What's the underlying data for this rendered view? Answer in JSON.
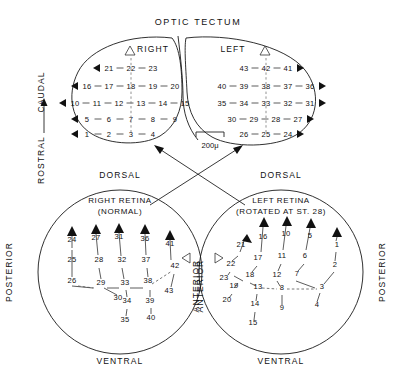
{
  "figure": {
    "title": "OPTIC TECTUM",
    "scale_bar_label": "200μ"
  },
  "tectum": {
    "right_label": "RIGHT",
    "left_label": "LEFT",
    "axis_label_rostral": "ROSTRAL",
    "axis_label_caudal": "CAUDAL",
    "right_lobe_rows": [
      {
        "values": [
          "21",
          "22",
          "23"
        ],
        "arrow": "left"
      },
      {
        "values": [
          "16",
          "17",
          "18",
          "19",
          "20"
        ],
        "arrow": "left"
      },
      {
        "values": [
          "10",
          "11",
          "12",
          "13",
          "14",
          "15"
        ],
        "arrow": "left"
      },
      {
        "values": [
          "5",
          "6",
          "7",
          "8",
          "9"
        ],
        "arrow": "left"
      },
      {
        "values": [
          "1",
          "2",
          "3",
          "4"
        ],
        "arrow": "left"
      }
    ],
    "left_lobe_rows": [
      {
        "values": [
          "43",
          "42",
          "41"
        ],
        "arrow": "right"
      },
      {
        "values": [
          "40",
          "39",
          "38",
          "37",
          "36"
        ],
        "arrow": "right"
      },
      {
        "values": [
          "35",
          "34",
          "33",
          "32",
          "31"
        ],
        "arrow": "right"
      },
      {
        "values": [
          "30",
          "29",
          "28",
          "27"
        ],
        "arrow": "right"
      },
      {
        "values": [
          "26",
          "25",
          "24"
        ],
        "arrow": "right"
      }
    ]
  },
  "right_retina": {
    "title_line1": "RIGHT RETINA",
    "title_line2": "(NORMAL)",
    "dorsal": "DORSAL",
    "ventral": "VENTRAL",
    "posterior": "POSTERIOR",
    "anterior": "ANTERIOR",
    "numbers": [
      "24",
      "25",
      "26",
      "27",
      "28",
      "29",
      "30",
      "31",
      "32",
      "33",
      "34",
      "35",
      "36",
      "37",
      "38",
      "39",
      "40",
      "41",
      "42",
      "43"
    ]
  },
  "left_retina": {
    "title_line1": "LEFT RETINA",
    "title_line2": "(ROTATED AT ST. 28)",
    "dorsal": "DORSAL",
    "ventral": "VENTRAL",
    "posterior": "POSTERIOR",
    "anterior": "ANTERIOR",
    "numbers": [
      "1",
      "2",
      "3",
      "4",
      "5",
      "6",
      "7",
      "8",
      "9",
      "10",
      "11",
      "12",
      "13",
      "14",
      "15",
      "16",
      "17",
      "18",
      "19",
      "20",
      "21",
      "22",
      "23"
    ]
  },
  "chart_data": {
    "type": "diagram",
    "title": "OPTIC TECTUM",
    "scale": "200μ",
    "tectum_right_rows": [
      [
        "21",
        "22",
        "23"
      ],
      [
        "16",
        "17",
        "18",
        "19",
        "20"
      ],
      [
        "10",
        "11",
        "12",
        "13",
        "14",
        "15"
      ],
      [
        "5",
        "6",
        "7",
        "8",
        "9"
      ],
      [
        "1",
        "2",
        "3",
        "4"
      ]
    ],
    "tectum_left_rows": [
      [
        "43",
        "42",
        "41"
      ],
      [
        "40",
        "39",
        "38",
        "37",
        "36"
      ],
      [
        "35",
        "34",
        "33",
        "32",
        "31"
      ],
      [
        "30",
        "29",
        "28",
        "27"
      ],
      [
        "26",
        "25",
        "24"
      ]
    ],
    "right_retina_points": [
      {
        "n": "24",
        "x": 72,
        "y": 242
      },
      {
        "n": "25",
        "x": 72,
        "y": 262
      },
      {
        "n": "26",
        "x": 72,
        "y": 283
      },
      {
        "n": "27",
        "x": 96,
        "y": 240
      },
      {
        "n": "28",
        "x": 99,
        "y": 262
      },
      {
        "n": "29",
        "x": 101,
        "y": 285
      },
      {
        "n": "30",
        "x": 118,
        "y": 300
      },
      {
        "n": "31",
        "x": 119,
        "y": 239
      },
      {
        "n": "32",
        "x": 122,
        "y": 262
      },
      {
        "n": "33",
        "x": 125,
        "y": 285
      },
      {
        "n": "34",
        "x": 127,
        "y": 303
      },
      {
        "n": "35",
        "x": 125,
        "y": 322
      },
      {
        "n": "36",
        "x": 145,
        "y": 241
      },
      {
        "n": "37",
        "x": 146,
        "y": 262
      },
      {
        "n": "38",
        "x": 148,
        "y": 283
      },
      {
        "n": "39",
        "x": 150,
        "y": 303
      },
      {
        "n": "40",
        "x": 151,
        "y": 320
      },
      {
        "n": "41",
        "x": 170,
        "y": 246
      },
      {
        "n": "42",
        "x": 175,
        "y": 268
      },
      {
        "n": "43",
        "x": 169,
        "y": 293
      }
    ],
    "left_retina_points": [
      {
        "n": "21",
        "x": 241,
        "y": 247
      },
      {
        "n": "22",
        "x": 231,
        "y": 266
      },
      {
        "n": "23",
        "x": 224,
        "y": 280
      },
      {
        "n": "19",
        "x": 234,
        "y": 288
      },
      {
        "n": "20",
        "x": 227,
        "y": 302
      },
      {
        "n": "16",
        "x": 263,
        "y": 239
      },
      {
        "n": "17",
        "x": 258,
        "y": 260
      },
      {
        "n": "18",
        "x": 250,
        "y": 277
      },
      {
        "n": "13",
        "x": 258,
        "y": 289
      },
      {
        "n": "14",
        "x": 255,
        "y": 306
      },
      {
        "n": "15",
        "x": 253,
        "y": 325
      },
      {
        "n": "10",
        "x": 286,
        "y": 236
      },
      {
        "n": "11",
        "x": 282,
        "y": 258
      },
      {
        "n": "12",
        "x": 277,
        "y": 277
      },
      {
        "n": "8",
        "x": 282,
        "y": 290
      },
      {
        "n": "9",
        "x": 282,
        "y": 310
      },
      {
        "n": "5",
        "x": 310,
        "y": 238
      },
      {
        "n": "6",
        "x": 305,
        "y": 258
      },
      {
        "n": "7",
        "x": 297,
        "y": 276
      },
      {
        "n": "3",
        "x": 322,
        "y": 289
      },
      {
        "n": "4",
        "x": 317,
        "y": 307
      },
      {
        "n": "1",
        "x": 337,
        "y": 247
      },
      {
        "n": "2",
        "x": 335,
        "y": 267
      }
    ]
  }
}
